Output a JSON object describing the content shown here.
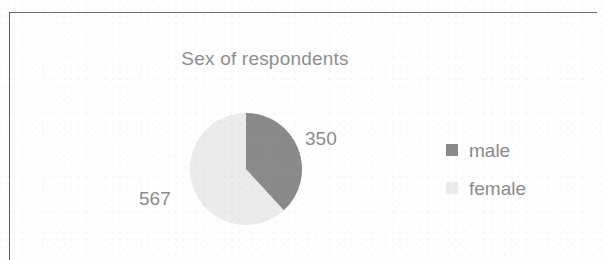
{
  "chart": {
    "title": "Sex of respondents",
    "frame_color": "#6d6d6d"
  },
  "legend": {
    "items": [
      {
        "label": "male",
        "color": "#8a8a8a"
      },
      {
        "label": "female",
        "color": "#ebebeb"
      }
    ]
  },
  "labels": {
    "male_value": "350",
    "female_value": "567"
  },
  "chart_data": {
    "type": "pie",
    "title": "Sex of respondents",
    "categories": [
      "male",
      "female"
    ],
    "values": [
      350,
      567
    ],
    "total": 917,
    "percentages": [
      38.2,
      61.8
    ],
    "colors": [
      "#8a8a8a",
      "#ebebeb"
    ],
    "data_labels": [
      "350",
      "567"
    ],
    "start_angle_deg": 0,
    "direction": "clockwise",
    "legend_position": "right",
    "grid": false
  }
}
